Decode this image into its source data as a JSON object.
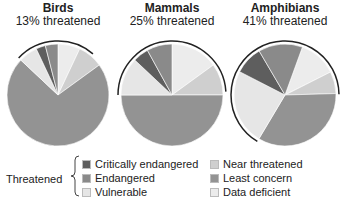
{
  "chart_data": [
    {
      "type": "pie",
      "title": "Birds",
      "subtitle": "13% threatened",
      "categories": [
        "Data deficient",
        "Near threatened",
        "Least concern",
        "Vulnerable",
        "Critically endangered",
        "Endangered"
      ],
      "values": [
        7,
        8,
        72,
        6,
        3,
        4
      ]
    },
    {
      "type": "pie",
      "title": "Mammals",
      "subtitle": "25% threatened",
      "categories": [
        "Data deficient",
        "Near threatened",
        "Least concern",
        "Vulnerable",
        "Critically endangered",
        "Endangered"
      ],
      "values": [
        15,
        10,
        50,
        12,
        5,
        8
      ]
    },
    {
      "type": "pie",
      "title": "Amphibians",
      "subtitle": "41% threatened",
      "categories": [
        "Data deficient",
        "Near threatened",
        "Least concern",
        "Vulnerable",
        "Critically endangered",
        "Endangered"
      ],
      "values": [
        12,
        7,
        34,
        24,
        9,
        14
      ]
    }
  ],
  "panels": [
    {
      "title": "Birds",
      "subtitle": "13% threatened"
    },
    {
      "title": "Mammals",
      "subtitle": "25% threatened"
    },
    {
      "title": "Amphibians",
      "subtitle": "41% threatened"
    }
  ],
  "legend": {
    "group_label": "Threatened",
    "items": [
      {
        "label": "Critically endangered",
        "color": "#5e5e5e"
      },
      {
        "label": "Endangered",
        "color": "#8a8a8a"
      },
      {
        "label": "Vulnerable",
        "color": "#e6e6e6"
      },
      {
        "label": "Near threatened",
        "color": "#cfcfcf"
      },
      {
        "label": "Least concern",
        "color": "#939393"
      },
      {
        "label": "Data deficient",
        "color": "#ececec"
      }
    ]
  }
}
